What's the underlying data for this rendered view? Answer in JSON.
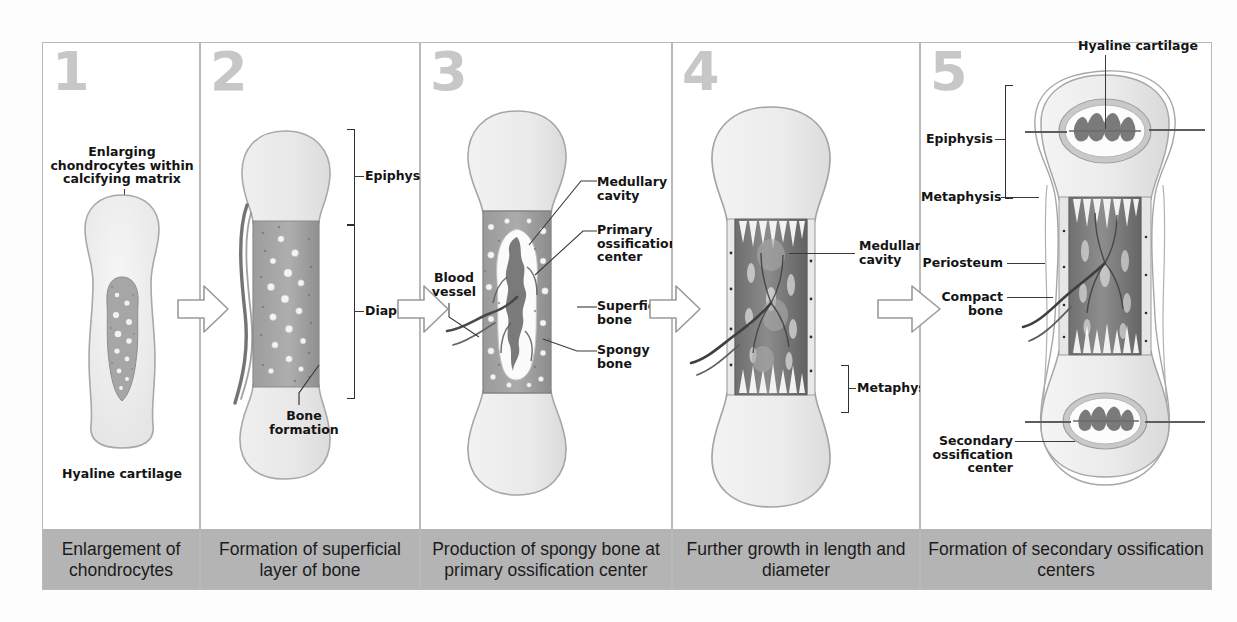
{
  "figure": {
    "panel_count": 5,
    "caption_bar_color": "#b4b4b4",
    "number_color": "#c7c7c7",
    "cartilage_color": "#ededed",
    "bone_color": "#9e9e9e",
    "marrow_color": "#7d7d7d"
  },
  "panels": [
    {
      "number": "1",
      "caption": "Enlargement of\nchondrocytes",
      "labels": {
        "top": "Enlarging\nchondrocytes within\ncalcifying matrix",
        "bottom": "Hyaline cartilage"
      }
    },
    {
      "number": "2",
      "caption": "Formation of superficial\nlayer of bone",
      "labels": {
        "epiphysis": "Epiphysis",
        "diaphysis": "Diaphysis",
        "bone_formation": "Bone\nformation"
      }
    },
    {
      "number": "3",
      "caption": "Production of spongy bone at\nprimary ossification center",
      "labels": {
        "blood_vessel": "Blood\nvessel",
        "medullary_cavity": "Medullary\ncavity",
        "primary_ossification_center": "Primary\nossification\ncenter",
        "superficial_bone": "Superficial\nbone",
        "spongy_bone": "Spongy\nbone"
      }
    },
    {
      "number": "4",
      "caption": "Further growth in length\nand diameter",
      "labels": {
        "medullary_cavity": "Medullary\ncavity",
        "metaphysis": "Metaphysis"
      }
    },
    {
      "number": "5",
      "caption": "Formation of secondary\nossification centers",
      "labels": {
        "hyaline_cartilage": "Hyaline cartilage",
        "epiphysis": "Epiphysis",
        "metaphysis": "Metaphysis",
        "periosteum": "Periosteum",
        "compact_bone": "Compact\nbone",
        "secondary_ossification_center": "Secondary\nossification\ncenter"
      }
    }
  ]
}
